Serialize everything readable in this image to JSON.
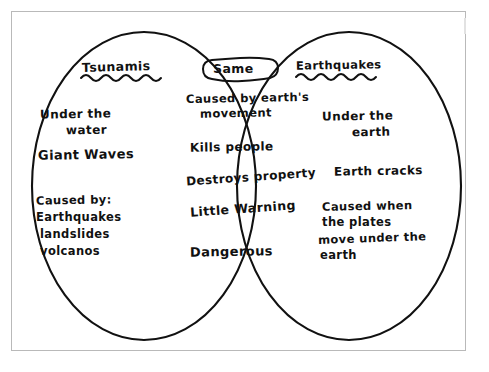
{
  "document": {
    "type": "hand-drawn Venn diagram worksheet",
    "topic": "Tsunamis and Earthquakes comparison"
  },
  "venn": {
    "left": {
      "heading": "Tsunamis",
      "underline_style": "wavy",
      "items": [
        "Under the",
        "water",
        "Giant Waves",
        "Caused by:",
        "Earthquakes",
        "landslides",
        "volcanos"
      ]
    },
    "center": {
      "heading": "Same",
      "heading_style": "cloud-bubble-outline",
      "items": [
        "Caused by earth's",
        "movement",
        "Kills  people",
        "Destroys property",
        "Little Warning",
        "Dangerous"
      ]
    },
    "right": {
      "heading": "Earthquakes",
      "underline_style": "wavy",
      "items": [
        "Under the",
        "earth",
        "Earth cracks",
        "Caused when",
        "the plates",
        "move under the",
        "earth"
      ]
    }
  },
  "colors": {
    "ink": "#111111",
    "paper": "#ffffff",
    "frame": "#b9b9b9"
  }
}
